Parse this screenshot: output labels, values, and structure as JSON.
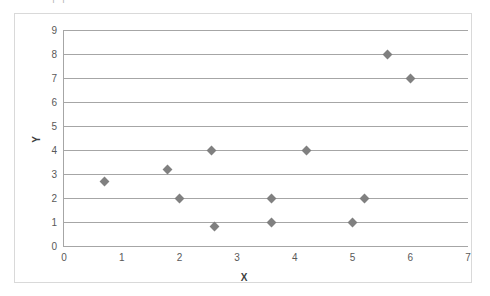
{
  "title_fragment": "|            |",
  "chart_data": {
    "type": "scatter",
    "title": "",
    "xlabel": "X",
    "ylabel": "Y",
    "xlim": [
      0,
      7
    ],
    "ylim": [
      0,
      9
    ],
    "xticks": [
      0,
      1,
      2,
      3,
      4,
      5,
      6,
      7
    ],
    "yticks": [
      0,
      1,
      2,
      3,
      4,
      5,
      6,
      7,
      8,
      9
    ],
    "grid": "horizontal",
    "legend": "none",
    "marker": "diamond",
    "marker_color": "#808080",
    "series": [
      {
        "name": "Series 1",
        "points": [
          {
            "x": 0.7,
            "y": 2.7
          },
          {
            "x": 1.8,
            "y": 3.2
          },
          {
            "x": 2.0,
            "y": 2.0
          },
          {
            "x": 2.55,
            "y": 4.0
          },
          {
            "x": 2.6,
            "y": 0.8
          },
          {
            "x": 3.6,
            "y": 2.0
          },
          {
            "x": 3.6,
            "y": 1.0
          },
          {
            "x": 4.2,
            "y": 4.0
          },
          {
            "x": 5.0,
            "y": 1.0
          },
          {
            "x": 5.2,
            "y": 2.0
          },
          {
            "x": 5.6,
            "y": 8.0
          },
          {
            "x": 6.0,
            "y": 7.0
          }
        ]
      }
    ]
  }
}
